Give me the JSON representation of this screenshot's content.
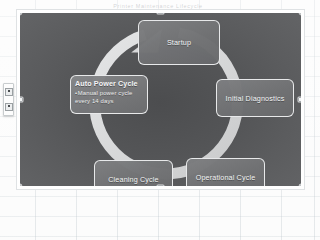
{
  "app": {
    "surface": "spreadsheet",
    "header_text": "Printer Maintenance Lifecycle",
    "colors": {
      "diagram_background": "#545557",
      "node_fill": "#707173",
      "node_border": "#f2f3f4",
      "arrow_ring": "#d9dadb",
      "text": "#f3f4f5",
      "sheet_background": "#fbfbfb",
      "gridline": "#96a5af"
    }
  },
  "mini_toolbar": {
    "buttons": [
      {
        "name": "quick-action-top",
        "label": ""
      },
      {
        "name": "quick-action-bottom",
        "label": ""
      }
    ]
  },
  "graphic": {
    "selected": true,
    "handles": [
      {
        "name": "handle-top-left",
        "position": "top-left"
      },
      {
        "name": "handle-top-center",
        "position": "top-center"
      },
      {
        "name": "handle-top-right",
        "position": "top-right"
      },
      {
        "name": "handle-middle-left",
        "position": "middle-left"
      },
      {
        "name": "handle-middle-right",
        "position": "middle-right"
      },
      {
        "name": "handle-bottom-left",
        "position": "bottom-left"
      },
      {
        "name": "handle-bottom-center",
        "position": "bottom-center"
      },
      {
        "name": "handle-bottom-right",
        "position": "bottom-right"
      }
    ]
  },
  "diagram": {
    "type": "cycle",
    "direction": "clockwise",
    "nodes": [
      {
        "id": "startup",
        "label": "Startup"
      },
      {
        "id": "diagnostics",
        "label": "Initial Diagnostics"
      },
      {
        "id": "operational",
        "label": "Operational Cycle"
      },
      {
        "id": "cleaning",
        "label": "Cleaning Cycle"
      }
    ],
    "callout": {
      "id": "auto-power-cycle",
      "title": "Auto Power Cycle",
      "bullets": [
        "Manual power cycle every 14 days"
      ]
    }
  }
}
